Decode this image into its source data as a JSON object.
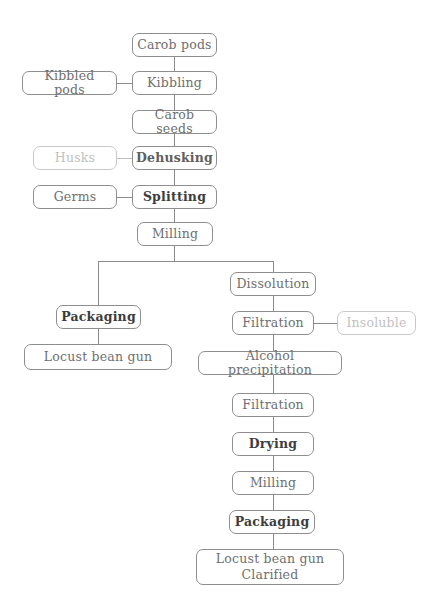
{
  "diagram": {
    "colors": {
      "node_border": "#8e8e8e",
      "node_text": "#6f6f6f",
      "node_text_bold": "#3d3d3d",
      "faint_text": "#c2c2c2",
      "faint_border": "#c9c9c9",
      "edge": "#8b8b8b",
      "background": "#ffffff"
    },
    "nodes": [
      {
        "id": "carob-pods",
        "label": "Carob pods",
        "emphasis": "normal",
        "x": 132,
        "y": 33,
        "w": 85,
        "h": 24
      },
      {
        "id": "kibbling",
        "label": "Kibbling",
        "emphasis": "normal",
        "x": 132,
        "y": 71,
        "w": 85,
        "h": 24
      },
      {
        "id": "kibbled-pods",
        "label": "Kibbled pods",
        "emphasis": "normal",
        "x": 22,
        "y": 71,
        "w": 95,
        "h": 24
      },
      {
        "id": "carob-seeds",
        "label": "Carob seeds",
        "emphasis": "normal",
        "x": 132,
        "y": 110,
        "w": 85,
        "h": 24
      },
      {
        "id": "dehusking",
        "label": "Dehusking",
        "emphasis": "semi",
        "x": 132,
        "y": 146,
        "w": 85,
        "h": 24
      },
      {
        "id": "husks",
        "label": "Husks",
        "emphasis": "faint",
        "x": 33,
        "y": 146,
        "w": 84,
        "h": 24
      },
      {
        "id": "splitting",
        "label": "Splitting",
        "emphasis": "bold",
        "x": 132,
        "y": 185,
        "w": 85,
        "h": 24
      },
      {
        "id": "germs",
        "label": "Germs",
        "emphasis": "normal",
        "x": 33,
        "y": 185,
        "w": 84,
        "h": 24
      },
      {
        "id": "milling-left",
        "label": "Milling",
        "emphasis": "normal",
        "x": 137,
        "y": 222,
        "w": 76,
        "h": 24
      },
      {
        "id": "packaging-left",
        "label": "Packaging",
        "emphasis": "bold",
        "x": 56,
        "y": 305,
        "w": 85,
        "h": 24
      },
      {
        "id": "locust-bean-gum",
        "label": "Locust bean gun",
        "emphasis": "normal",
        "x": 24,
        "y": 344,
        "w": 148,
        "h": 26
      },
      {
        "id": "dissolution",
        "label": "Dissolution",
        "emphasis": "normal",
        "x": 230,
        "y": 272,
        "w": 86,
        "h": 24
      },
      {
        "id": "filtration-1",
        "label": "Filtration",
        "emphasis": "normal",
        "x": 232,
        "y": 311,
        "w": 82,
        "h": 24
      },
      {
        "id": "insoluble",
        "label": "Insoluble",
        "emphasis": "faint",
        "x": 337,
        "y": 311,
        "w": 79,
        "h": 24
      },
      {
        "id": "alcohol-precipitation",
        "label": "Alcohol precipitation",
        "emphasis": "normal",
        "x": 198,
        "y": 351,
        "w": 144,
        "h": 24
      },
      {
        "id": "filtration-2",
        "label": "Filtration",
        "emphasis": "normal",
        "x": 232,
        "y": 393,
        "w": 82,
        "h": 24
      },
      {
        "id": "drying",
        "label": "Drying",
        "emphasis": "bold",
        "x": 232,
        "y": 432,
        "w": 82,
        "h": 24
      },
      {
        "id": "milling-right",
        "label": "Milling",
        "emphasis": "normal",
        "x": 232,
        "y": 471,
        "w": 82,
        "h": 24
      },
      {
        "id": "packaging-right",
        "label": "Packaging",
        "emphasis": "bold",
        "x": 229,
        "y": 510,
        "w": 86,
        "h": 24
      },
      {
        "id": "locust-bean-gum-clarified",
        "label": "Locust bean gun\nClarified",
        "emphasis": "normal",
        "x": 196,
        "y": 549,
        "w": 148,
        "h": 36
      }
    ],
    "edges": [
      {
        "id": "carob-pods-to-kibbling",
        "from": "carob-pods",
        "to": "kibbling",
        "orient": "v",
        "x": 174,
        "y": 57,
        "len": 14,
        "faint": false
      },
      {
        "id": "kibbled-pods-to-kibbling",
        "from": "kibbled-pods",
        "to": "kibbling",
        "orient": "h",
        "x": 117,
        "y": 83,
        "len": 15,
        "faint": false
      },
      {
        "id": "kibbling-to-carob-seeds",
        "from": "kibbling",
        "to": "carob-seeds",
        "orient": "v",
        "x": 174,
        "y": 95,
        "len": 15,
        "faint": false
      },
      {
        "id": "carob-seeds-to-dehusking",
        "from": "carob-seeds",
        "to": "dehusking",
        "orient": "v",
        "x": 174,
        "y": 134,
        "len": 12,
        "faint": false
      },
      {
        "id": "husks-to-dehusking",
        "from": "husks",
        "to": "dehusking",
        "orient": "h",
        "x": 117,
        "y": 158,
        "len": 15,
        "faint": true
      },
      {
        "id": "dehusking-to-splitting",
        "from": "dehusking",
        "to": "splitting",
        "orient": "v",
        "x": 174,
        "y": 170,
        "len": 15,
        "faint": false
      },
      {
        "id": "germs-to-splitting",
        "from": "germs",
        "to": "splitting",
        "orient": "h",
        "x": 117,
        "y": 197,
        "len": 15,
        "faint": false
      },
      {
        "id": "splitting-to-milling",
        "from": "splitting",
        "to": "milling-left",
        "orient": "v",
        "x": 174,
        "y": 209,
        "len": 13,
        "faint": false
      },
      {
        "id": "milling-to-branch",
        "from": "milling-left",
        "to": "branch",
        "orient": "v",
        "x": 174,
        "y": 246,
        "len": 16,
        "faint": false
      },
      {
        "id": "branch-horizontal",
        "from": "branch",
        "to": "branch",
        "orient": "h",
        "x": 98,
        "y": 261,
        "len": 176,
        "faint": false
      },
      {
        "id": "branch-to-packaging-left",
        "from": "branch",
        "to": "packaging-left",
        "orient": "v",
        "x": 98,
        "y": 261,
        "len": 44,
        "faint": false
      },
      {
        "id": "branch-to-dissolution",
        "from": "branch",
        "to": "dissolution",
        "orient": "v",
        "x": 273,
        "y": 261,
        "len": 11,
        "faint": false
      },
      {
        "id": "packaging-left-to-gum",
        "from": "packaging-left",
        "to": "locust-bean-gum",
        "orient": "v",
        "x": 98,
        "y": 329,
        "len": 15,
        "faint": false
      },
      {
        "id": "dissolution-to-filtration1",
        "from": "dissolution",
        "to": "filtration-1",
        "orient": "v",
        "x": 273,
        "y": 296,
        "len": 15,
        "faint": false
      },
      {
        "id": "filtration1-to-insoluble",
        "from": "filtration-1",
        "to": "insoluble",
        "orient": "h",
        "x": 314,
        "y": 323,
        "len": 23,
        "faint": false
      },
      {
        "id": "filtration1-to-alcohol",
        "from": "filtration-1",
        "to": "alcohol-precipitation",
        "orient": "v",
        "x": 273,
        "y": 335,
        "len": 16,
        "faint": false
      },
      {
        "id": "alcohol-to-filtration2",
        "from": "alcohol-precipitation",
        "to": "filtration-2",
        "orient": "v",
        "x": 273,
        "y": 375,
        "len": 18,
        "faint": false
      },
      {
        "id": "filtration2-to-drying",
        "from": "filtration-2",
        "to": "drying",
        "orient": "v",
        "x": 273,
        "y": 417,
        "len": 15,
        "faint": false
      },
      {
        "id": "drying-to-milling-right",
        "from": "drying",
        "to": "milling-right",
        "orient": "v",
        "x": 273,
        "y": 456,
        "len": 15,
        "faint": false
      },
      {
        "id": "milling-right-to-packaging-right",
        "from": "milling-right",
        "to": "packaging-right",
        "orient": "v",
        "x": 273,
        "y": 495,
        "len": 15,
        "faint": false
      },
      {
        "id": "packaging-right-to-clarified",
        "from": "packaging-right",
        "to": "locust-bean-gum-clarified",
        "orient": "v",
        "x": 273,
        "y": 534,
        "len": 15,
        "faint": false
      }
    ]
  }
}
